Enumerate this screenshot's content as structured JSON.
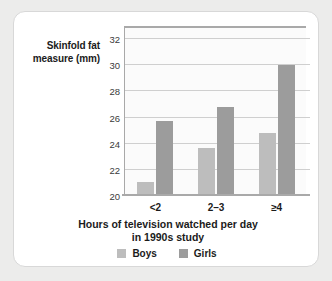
{
  "chart_data": {
    "type": "bar",
    "title": "",
    "subtitle": "",
    "categories": [
      "<2",
      "2–3",
      "≥4"
    ],
    "series": [
      {
        "name": "Boys",
        "values": [
          21.1,
          23.7,
          24.8
        ],
        "color": "#bdbdbd"
      },
      {
        "name": "Girls",
        "values": [
          25.7,
          26.8,
          30.0
        ],
        "color": "#9c9c9c"
      }
    ],
    "xlabel": "Hours of television watched per day in 1990s study",
    "ylabel": "Skinfold fat measure (mm)",
    "ylim": [
      20,
      33
    ],
    "yticks": [
      20,
      22,
      24,
      26,
      28,
      30,
      32
    ],
    "grid": true,
    "legend_position": "bottom-center"
  },
  "axis": {
    "y_title_line1": "Skinfold fat",
    "y_title_line2": "measure (mm)",
    "x_title_line1": "Hours of television watched per day",
    "x_title_line2": "in 1990s study"
  },
  "legend": {
    "items": [
      {
        "label": "Boys",
        "color": "#bdbdbd"
      },
      {
        "label": "Girls",
        "color": "#9c9c9c"
      }
    ]
  },
  "colors": {
    "page_background": "#ececeb",
    "card_background": "#ffffff",
    "card_border": "#d8d8d8",
    "plot_background": "#fbfbfb",
    "axis_line": "#a9a9a9",
    "gridline": "#cfcfcf",
    "boys_bar": "#bdbdbd",
    "girls_bar": "#9c9c9c",
    "text": "#1b1b1b"
  }
}
